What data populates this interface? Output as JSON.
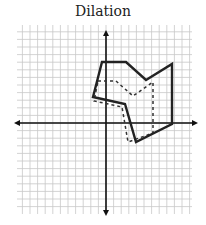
{
  "title": "Dilation",
  "diagram": {
    "type": "coordinate-grid-dilation",
    "origin_px": [
      106,
      123
    ],
    "grid_px": {
      "x0": 17,
      "x1": 192,
      "y0": 25,
      "y1": 214,
      "step": 7.6
    },
    "axes": {
      "x_left": 14,
      "x_right": 198,
      "y_top": 30,
      "y_bottom": 216
    },
    "colors": {
      "grid": "#c8c8c8",
      "axis": "#111111",
      "shape": "#222222"
    },
    "solid_figure": {
      "label": "original",
      "points": [
        [
          102,
          62
        ],
        [
          126,
          62
        ],
        [
          146,
          80
        ],
        [
          172,
          64
        ],
        [
          172,
          124
        ],
        [
          136,
          142
        ],
        [
          125,
          104
        ],
        [
          93,
          97
        ]
      ]
    },
    "dashed_figure": {
      "label": "image",
      "points": [
        [
          98,
          81
        ],
        [
          116,
          81
        ],
        [
          133,
          96
        ],
        [
          153,
          82
        ],
        [
          153,
          133
        ],
        [
          128,
          142
        ],
        [
          122,
          107
        ],
        [
          94,
          101
        ]
      ]
    }
  }
}
